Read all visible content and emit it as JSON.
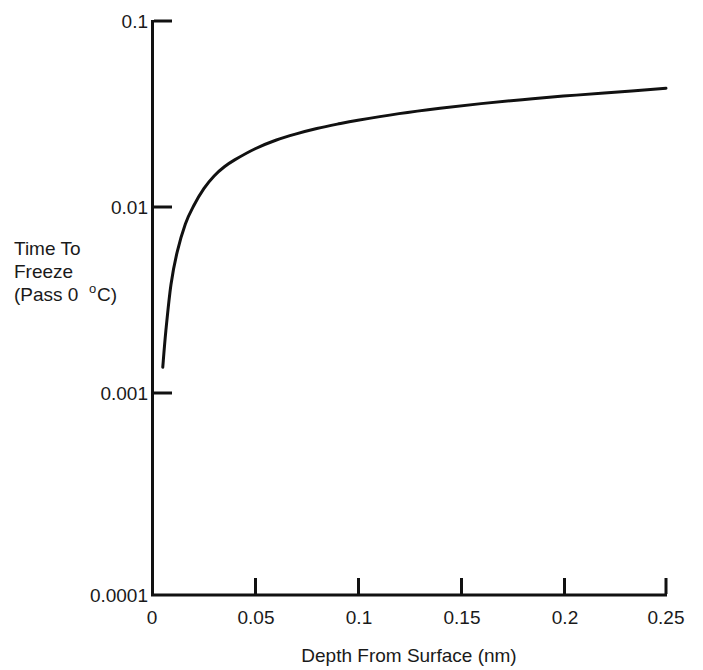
{
  "chart_data": {
    "type": "line",
    "title": "",
    "xlabel": "Depth From Surface (nm)",
    "ylabel_lines": [
      "Time To",
      "Freeze",
      "(Pass 0",
      "C)"
    ],
    "ylabel_full": "Time To Freeze (Pass 0 °C)",
    "xlim": [
      0,
      0.25
    ],
    "ylim": [
      0.0001,
      0.1
    ],
    "yscale": "log",
    "xscale": "linear",
    "grid": false,
    "legend": null,
    "xticks": [
      "0",
      "0.05",
      "0.1",
      "0.15",
      "0.2",
      "0.25"
    ],
    "xtick_values": [
      0,
      0.05,
      0.1,
      0.15,
      0.2,
      0.25
    ],
    "yticks": [
      "0.1",
      "0.01",
      "0.001",
      "0.0001"
    ],
    "ytick_values": [
      0.1,
      0.01,
      0.001,
      0.0001
    ],
    "series": [
      {
        "name": "Time to freeze vs depth",
        "x": [
          0.005,
          0.0065,
          0.009,
          0.012,
          0.016,
          0.02,
          0.025,
          0.03,
          0.035,
          0.04,
          0.05,
          0.06,
          0.07,
          0.08,
          0.09,
          0.1,
          0.12,
          0.14,
          0.16,
          0.18,
          0.2,
          0.22,
          0.25
        ],
        "y": [
          0.00155,
          0.0024,
          0.0042,
          0.0062,
          0.0087,
          0.0108,
          0.0133,
          0.0155,
          0.0173,
          0.0188,
          0.0215,
          0.0238,
          0.0257,
          0.0274,
          0.0289,
          0.0303,
          0.0328,
          0.035,
          0.037,
          0.0388,
          0.0405,
          0.042,
          0.0445
        ]
      }
    ]
  },
  "axis_symbols": {
    "degree": "o"
  },
  "colors": {
    "curve": "#111111",
    "axis": "#111111",
    "background": "#ffffff",
    "text": "#1a1a1a"
  }
}
